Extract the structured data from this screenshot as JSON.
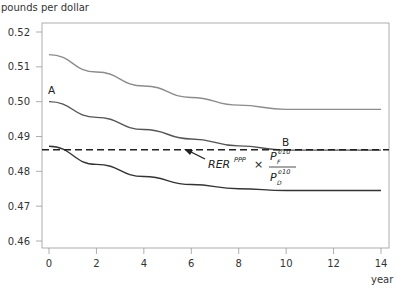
{
  "chart_data": {
    "type": "line",
    "title": "",
    "ylabel": "pounds per dollar",
    "xlabel": "year",
    "xlim": [
      0,
      14
    ],
    "ylim": [
      0.4575,
      0.5225
    ],
    "x_ticks": [
      "0",
      "2",
      "4",
      "6",
      "8",
      "10",
      "12",
      "14"
    ],
    "y_ticks": [
      "0.52",
      "0.51",
      "0.50",
      "0.49",
      "0.48",
      "0.47",
      "0.46"
    ],
    "grid": false,
    "series": [
      {
        "name": "upper path (light gray)",
        "color": "#8c8c8c",
        "style": "solid",
        "x": [
          0,
          2,
          4,
          6,
          8,
          10,
          12,
          14
        ],
        "values": [
          0.5135,
          0.5085,
          0.5045,
          0.5012,
          0.499,
          0.4978,
          0.4978,
          0.4978
        ]
      },
      {
        "name": "middle path A to B",
        "color": "#555555",
        "style": "solid",
        "x": [
          0,
          2,
          4,
          6,
          8,
          10,
          12,
          14
        ],
        "values": [
          0.5,
          0.4955,
          0.492,
          0.4893,
          0.4873,
          0.4861,
          0.4861,
          0.4861
        ]
      },
      {
        "name": "lower path",
        "color": "#333333",
        "style": "solid",
        "x": [
          0,
          2,
          4,
          6,
          8,
          10,
          12,
          14
        ],
        "values": [
          0.4872,
          0.482,
          0.4785,
          0.4762,
          0.475,
          0.4745,
          0.4745,
          0.4745
        ]
      },
      {
        "name": "RER^PPP x P_F^e10 / P_D^e10",
        "color": "#222222",
        "style": "dashed",
        "x": [
          0,
          14
        ],
        "values": [
          0.4862,
          0.4862
        ]
      }
    ],
    "annotations": [
      {
        "text": "A",
        "x": 0,
        "y": 0.5
      },
      {
        "text": "B",
        "x": 10,
        "y": 0.4862
      },
      {
        "text": "RER^PPP × P_F^e10 / P_D^e10",
        "arrow_to_x": 4.1,
        "arrow_to_y": 0.4862
      }
    ]
  },
  "labels": {
    "ylabel": "pounds per dollar",
    "xlabel": "year",
    "point_a": "A",
    "point_b": "B",
    "formula_rer": "RER",
    "formula_rer_sup": "PPP",
    "formula_times": "×",
    "formula_num_p": "P",
    "formula_num_sub": "F",
    "formula_num_sup": "e10",
    "formula_den_p": "P",
    "formula_den_sub": "D",
    "formula_den_sup": "e10"
  }
}
